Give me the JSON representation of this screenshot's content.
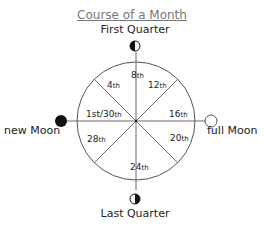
{
  "title": "Course of a Month",
  "phases": {
    "top": "First Quarter",
    "left": "new Moon",
    "right": "full Moon",
    "bottom": "Last Quarter"
  },
  "segments": [
    {
      "day": "8",
      "suffix": "th"
    },
    {
      "day": "12",
      "suffix": "th"
    },
    {
      "day": "16",
      "suffix": "th"
    },
    {
      "day": "20",
      "suffix": "th"
    },
    {
      "day": "24",
      "suffix": "th"
    },
    {
      "day": "28",
      "suffix": "th"
    },
    {
      "day": "1st/30",
      "suffix": "th"
    },
    {
      "day": "4",
      "suffix": "th"
    }
  ]
}
